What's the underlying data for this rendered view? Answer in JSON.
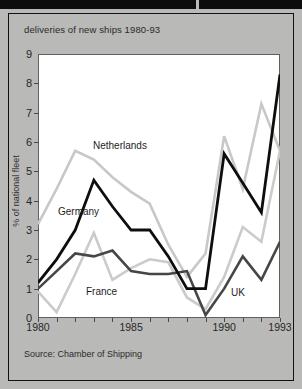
{
  "figure": {
    "title": "deliveries of new ships 1980-93",
    "source": "Source: Chamber of Shipping",
    "background_color": "#b9b9b7",
    "plot_background_color": "#ffffff",
    "frame_color": "#111111"
  },
  "chart_data": {
    "type": "line",
    "title": "deliveries of new ships 1980-93",
    "xlabel": "",
    "ylabel": "% of national fleet",
    "xlim": [
      1980,
      1993
    ],
    "ylim": [
      0,
      9
    ],
    "grid": false,
    "legend": "inline-labels",
    "x": [
      1980,
      1981,
      1982,
      1983,
      1984,
      1985,
      1986,
      1987,
      1988,
      1989,
      1990,
      1991,
      1992,
      1993
    ],
    "xticks": [
      1980,
      1985,
      1990,
      1993
    ],
    "xtick_labels": [
      "1980",
      "1985",
      "1990",
      "1993"
    ],
    "yticks": [
      0,
      1,
      2,
      3,
      4,
      5,
      6,
      7,
      8,
      9
    ],
    "ytick_labels": [
      "0",
      "1",
      "2",
      "3",
      "4",
      "5",
      "6",
      "7",
      "8",
      "9"
    ],
    "series": [
      {
        "name": "Netherlands",
        "color": "#c8c8c8",
        "width": 2.6,
        "values": [
          3.2,
          4.4,
          5.7,
          5.4,
          4.8,
          4.3,
          3.9,
          2.5,
          1.4,
          2.2,
          6.2,
          4.4,
          7.3,
          5.7
        ]
      },
      {
        "name": "Germany",
        "color": "#0e0e0e",
        "width": 2.8,
        "values": [
          1.2,
          2.0,
          3.0,
          4.7,
          3.8,
          3.0,
          3.0,
          2.1,
          1.0,
          1.0,
          5.6,
          4.6,
          3.6,
          8.3
        ]
      },
      {
        "name": "France",
        "color": "#464646",
        "width": 2.6,
        "values": [
          1.0,
          1.6,
          2.2,
          2.1,
          2.3,
          1.6,
          1.5,
          1.5,
          1.6,
          0.1,
          1.0,
          2.1,
          1.3,
          2.6
        ]
      },
      {
        "name": "UK",
        "color": "#cbcbcb",
        "width": 2.6,
        "values": [
          0.9,
          0.2,
          1.5,
          2.9,
          1.3,
          1.7,
          2.0,
          1.9,
          0.7,
          0.3,
          1.4,
          3.1,
          2.6,
          5.7
        ]
      }
    ],
    "annotations": [
      {
        "text": "Netherlands",
        "series": "Netherlands"
      },
      {
        "text": "Germany",
        "series": "Germany"
      },
      {
        "text": "France",
        "series": "France"
      },
      {
        "text": "UK",
        "series": "UK"
      }
    ]
  }
}
